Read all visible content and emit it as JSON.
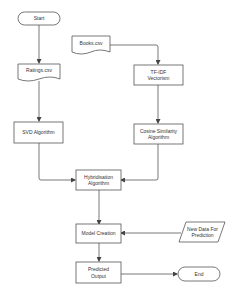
{
  "diagram": {
    "type": "flowchart",
    "colors": {
      "stroke": "#555555",
      "fill": "#ffffff",
      "text": "#333333",
      "background": "#ffffff"
    },
    "nodes": [
      {
        "id": "start",
        "shape": "terminal",
        "label": "Start"
      },
      {
        "id": "books",
        "shape": "document",
        "label": "Books.csv"
      },
      {
        "id": "ratings",
        "shape": "document",
        "label": "Ratings.csv"
      },
      {
        "id": "tfidf",
        "shape": "process",
        "label": "TF-IDF Vectorism"
      },
      {
        "id": "svd",
        "shape": "process",
        "label": "SVD Algorithm"
      },
      {
        "id": "cosine",
        "shape": "process",
        "label": "Cosine Similarity Algorithm"
      },
      {
        "id": "hybrid",
        "shape": "process",
        "label": "Hybridisation Algorithm"
      },
      {
        "id": "model",
        "shape": "process",
        "label": "Model Creation"
      },
      {
        "id": "newdata",
        "shape": "data",
        "label": "New Data For Prediction"
      },
      {
        "id": "predicted",
        "shape": "process",
        "label": "Predicted Output"
      },
      {
        "id": "end",
        "shape": "terminal",
        "label": "End"
      }
    ],
    "edges": [
      {
        "from": "start",
        "to": "ratings"
      },
      {
        "from": "books",
        "to": "tfidf"
      },
      {
        "from": "ratings",
        "to": "svd"
      },
      {
        "from": "tfidf",
        "to": "cosine"
      },
      {
        "from": "svd",
        "to": "hybrid"
      },
      {
        "from": "cosine",
        "to": "hybrid"
      },
      {
        "from": "hybrid",
        "to": "model"
      },
      {
        "from": "newdata",
        "to": "model"
      },
      {
        "from": "model",
        "to": "predicted"
      },
      {
        "from": "predicted",
        "to": "end"
      }
    ]
  },
  "labels": {
    "start": "Start",
    "books": "Books.csv",
    "ratings": "Ratings.csv",
    "tfidf": "TF-IDF Vectorism",
    "svd": "SVD Algorithm",
    "cosine": "Cosine Similarity Algorithm",
    "hybrid": "Hybridisation Algorithm",
    "model": "Model Creation",
    "newdata": "New Data For Prediction",
    "predicted": "Predicted Output",
    "end": "End"
  }
}
